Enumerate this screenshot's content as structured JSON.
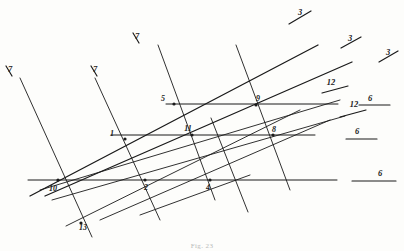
{
  "figure": {
    "caption": "Fig. 23",
    "background_color": "#fdfdfb",
    "ink_color": "#1a1a1a",
    "canvas": {
      "width": 404,
      "height": 251
    }
  },
  "chart_data": {
    "type": "scatter",
    "xlabel": "",
    "ylabel": "",
    "xlim": [
      0,
      404
    ],
    "ylim": [
      0,
      251
    ],
    "grid": false,
    "legend_position": "right",
    "points": [
      {
        "label": "1",
        "x": 125,
        "y": 139,
        "label_x": 112,
        "label_y": 136
      },
      {
        "label": "2",
        "x": 145,
        "y": 180,
        "label_x": 146,
        "label_y": 190
      },
      {
        "label": "4",
        "x": 210,
        "y": 180,
        "label_x": 208,
        "label_y": 190
      },
      {
        "label": "5",
        "x": 174,
        "y": 104,
        "label_x": 163,
        "label_y": 101
      },
      {
        "label": "8",
        "x": 273,
        "y": 135,
        "label_x": 274,
        "label_y": 132
      },
      {
        "label": "9",
        "x": 256,
        "y": 105,
        "label_x": 258,
        "label_y": 101
      },
      {
        "label": "10",
        "x": 58,
        "y": 180,
        "label_x": 53,
        "label_y": 191
      },
      {
        "label": "11",
        "x": 192,
        "y": 135,
        "label_x": 188,
        "label_y": 131
      },
      {
        "label": "13",
        "x": 81,
        "y": 223,
        "label_x": 83,
        "label_y": 230
      }
    ],
    "lines": [
      {
        "name": "horizontal-top",
        "kind": "horizontal",
        "x1": 166,
        "y1": 104,
        "x2": 338,
        "y2": 104,
        "weight": 1.0
      },
      {
        "name": "horizontal-middle",
        "kind": "horizontal",
        "x1": 111,
        "y1": 135,
        "x2": 315,
        "y2": 135,
        "weight": 1.0
      },
      {
        "name": "horizontal-bottom",
        "kind": "horizontal",
        "x1": 28,
        "y1": 180,
        "x2": 337,
        "y2": 180,
        "weight": 1.0
      },
      {
        "name": "steep-1",
        "kind": "steep",
        "x1": 20,
        "y1": 78,
        "x2": 92,
        "y2": 237,
        "weight": 0.9
      },
      {
        "name": "steep-2",
        "kind": "steep",
        "x1": 95,
        "y1": 78,
        "x2": 160,
        "y2": 220,
        "weight": 0.9
      },
      {
        "name": "steep-3",
        "kind": "steep",
        "x1": 158,
        "y1": 45,
        "x2": 215,
        "y2": 200,
        "weight": 0.9
      },
      {
        "name": "steep-4",
        "kind": "steep",
        "x1": 236,
        "y1": 45,
        "x2": 290,
        "y2": 190,
        "weight": 0.9
      },
      {
        "name": "steep-5",
        "kind": "steep",
        "x1": 211,
        "y1": 118,
        "x2": 248,
        "y2": 212,
        "weight": 0.9
      },
      {
        "name": "rising-1",
        "kind": "rising",
        "x1": 30,
        "y1": 196,
        "x2": 318,
        "y2": 45,
        "weight": 1.3
      },
      {
        "name": "rising-2",
        "kind": "rising",
        "x1": 45,
        "y1": 196,
        "x2": 352,
        "y2": 62,
        "weight": 1.3
      },
      {
        "name": "rising-3",
        "kind": "rising",
        "x1": 40,
        "y1": 190,
        "x2": 340,
        "y2": 100,
        "weight": 0.9
      },
      {
        "name": "rising-4",
        "kind": "rising",
        "x1": 52,
        "y1": 200,
        "x2": 345,
        "y2": 116,
        "weight": 0.9
      },
      {
        "name": "rising-5",
        "kind": "rising",
        "x1": 100,
        "y1": 220,
        "x2": 330,
        "y2": 120,
        "weight": 0.9
      },
      {
        "name": "rising-6",
        "kind": "rising",
        "x1": 66,
        "y1": 226,
        "x2": 300,
        "y2": 110,
        "weight": 0.9
      },
      {
        "name": "rising-7",
        "kind": "rising",
        "x1": 140,
        "y1": 215,
        "x2": 250,
        "y2": 175,
        "weight": 0.9
      }
    ],
    "markers": [
      {
        "label": "7",
        "kind": "tick-backslash",
        "label_x": 10,
        "label_y": 72,
        "x1": 6,
        "y1": 66,
        "x2": 12,
        "y2": 76
      },
      {
        "label": "7",
        "kind": "tick-backslash",
        "label_x": 95,
        "label_y": 72,
        "x1": 91,
        "y1": 66,
        "x2": 97,
        "y2": 76
      },
      {
        "label": "7",
        "kind": "tick-backslash",
        "label_x": 137,
        "label_y": 39,
        "x1": 133,
        "y1": 33,
        "x2": 139,
        "y2": 43
      },
      {
        "label": "3",
        "kind": "tick-slash",
        "label_x": 300,
        "label_y": 15,
        "x1": 289,
        "y1": 24,
        "x2": 311,
        "y2": 11
      },
      {
        "label": "3",
        "kind": "tick-slash",
        "label_x": 350,
        "label_y": 41,
        "x1": 341,
        "y1": 48,
        "x2": 361,
        "y2": 37
      },
      {
        "label": "3",
        "kind": "tick-slash",
        "label_x": 388,
        "label_y": 55,
        "x1": 379,
        "y1": 62,
        "x2": 398,
        "y2": 51
      },
      {
        "label": "12",
        "kind": "tick-slash",
        "label_x": 331,
        "label_y": 85,
        "x1": 322,
        "y1": 93,
        "x2": 348,
        "y2": 86
      },
      {
        "label": "12",
        "kind": "tick-slash",
        "label_x": 354,
        "label_y": 107,
        "x1": 340,
        "y1": 117,
        "x2": 366,
        "y2": 110
      },
      {
        "label": "6",
        "kind": "tick-horizontal",
        "label_x": 370,
        "label_y": 101,
        "x1": 359,
        "y1": 105,
        "x2": 390,
        "y2": 105
      },
      {
        "label": "6",
        "kind": "tick-horizontal",
        "label_x": 357,
        "label_y": 134,
        "x1": 346,
        "y1": 139,
        "x2": 377,
        "y2": 139
      },
      {
        "label": "6",
        "kind": "tick-horizontal",
        "label_x": 380,
        "label_y": 176,
        "x1": 352,
        "y1": 181,
        "x2": 396,
        "y2": 181
      }
    ]
  }
}
